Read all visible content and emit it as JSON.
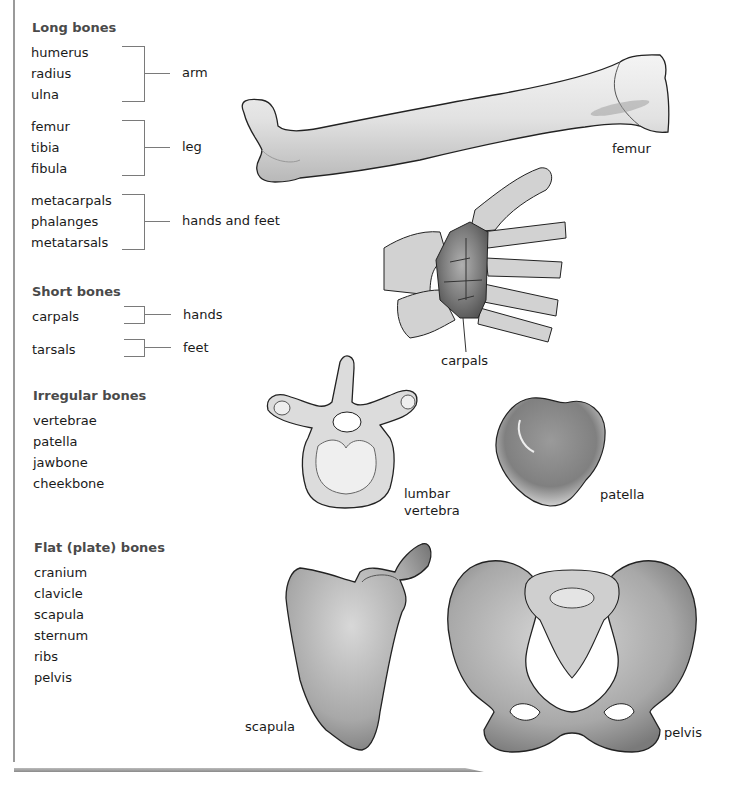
{
  "sections": {
    "long": {
      "heading": "Long bones",
      "groups": [
        {
          "items": [
            "humerus",
            "radius",
            "ulna"
          ],
          "label": "arm"
        },
        {
          "items": [
            "femur",
            "tibia",
            "fibula"
          ],
          "label": "leg"
        },
        {
          "items": [
            "metacarpals",
            "phalanges",
            "metatarsals"
          ],
          "label": "hands and feet"
        }
      ]
    },
    "short": {
      "heading": "Short bones",
      "groups": [
        {
          "items": [
            "carpals"
          ],
          "label": "hands"
        },
        {
          "items": [
            "tarsals"
          ],
          "label": "feet"
        }
      ]
    },
    "irregular": {
      "heading": "Irregular bones",
      "items": [
        "vertebrae",
        "patella",
        "jawbone",
        "cheekbone"
      ]
    },
    "flat": {
      "heading": "Flat (plate) bones",
      "items": [
        "cranium",
        "clavicle",
        "scapula",
        "sternum",
        "ribs",
        "pelvis"
      ]
    }
  },
  "illustrations": {
    "femur": "femur",
    "carpals": "carpals",
    "vertebra_line1": "lumbar",
    "vertebra_line2": "vertebra",
    "patella": "patella",
    "scapula": "scapula",
    "pelvis": "pelvis"
  },
  "colors": {
    "heading": "#4a4a4a",
    "text": "#1a1a1a",
    "bone_light": "#e6e6e6",
    "bone_mid": "#9a9a9a",
    "bone_dark": "#5c5c5c",
    "outline": "#222222"
  }
}
